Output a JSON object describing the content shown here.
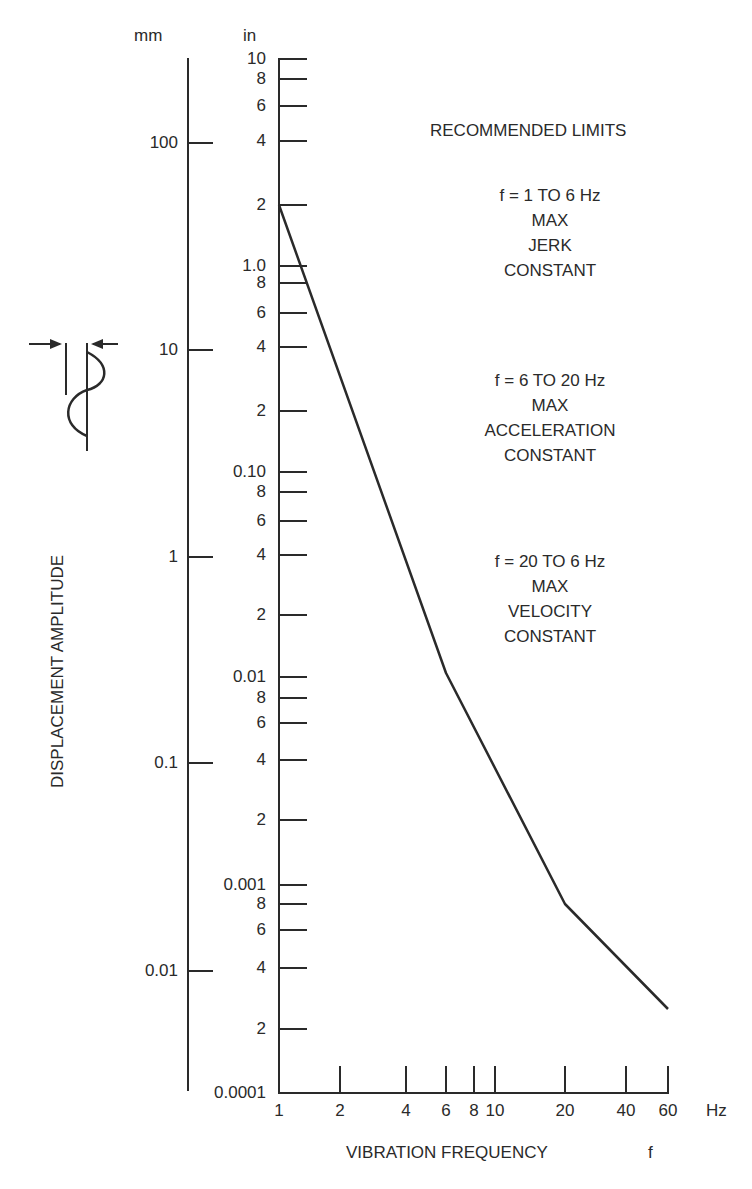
{
  "chart_data": {
    "type": "line",
    "title": "RECOMMENDED LIMITS",
    "xlabel": "VIBRATION FREQUENCY",
    "xlabel_symbol": "f",
    "x_unit": "Hz",
    "ylabel": "DISPLACEMENT AMPLITUDE",
    "y_units": [
      "mm",
      "in"
    ],
    "x_scale": "log",
    "y_scale": "log",
    "xlim": [
      1,
      60
    ],
    "ylim_in": [
      0.0001,
      10
    ],
    "x_ticks": [
      "1",
      "2",
      "4",
      "6",
      "8",
      "10",
      "20",
      "40",
      "60"
    ],
    "y_ticks_in": [
      "10",
      "8",
      "6",
      "4",
      "2",
      "1.0",
      "8",
      "6",
      "4",
      "2",
      "0.10",
      "8",
      "6",
      "4",
      "2",
      "0.01",
      "8",
      "6",
      "4",
      "2",
      "0.001",
      "8",
      "6",
      "4",
      "2",
      "0.0001"
    ],
    "y_ticks_mm": [
      "100",
      "10",
      "1",
      "0.1",
      "0.01"
    ],
    "grid": false,
    "series": [
      {
        "name": "Recommended limit",
        "x": [
          1,
          6,
          20,
          60
        ],
        "y_in": [
          2,
          0.01,
          0.0008,
          0.00025
        ]
      }
    ],
    "annotations": [
      {
        "lines": [
          "f = 1 TO 6 Hz",
          "MAX",
          "JERK",
          "CONSTANT"
        ]
      },
      {
        "lines": [
          "f = 6 TO 20 Hz",
          "MAX",
          "ACCELERATION",
          "CONSTANT"
        ]
      },
      {
        "lines": [
          "f = 20 TO 6 Hz",
          "MAX",
          "VELOCITY",
          "CONSTANT"
        ]
      }
    ]
  },
  "labels": {
    "mm": "mm",
    "in": "in",
    "hz": "Hz",
    "f": "f",
    "xlabel": "VIBRATION FREQUENCY",
    "ylabel": "DISPLACEMENT AMPLITUDE",
    "title": "RECOMMENDED LIMITS"
  },
  "mm_ticks": [
    {
      "label": "100",
      "y": 143
    },
    {
      "label": "10",
      "y": 350
    },
    {
      "label": "1",
      "y": 557
    },
    {
      "label": "0.1",
      "y": 763
    },
    {
      "label": "0.01",
      "y": 971
    }
  ],
  "in_ticks": [
    {
      "label": "10",
      "y": 59
    },
    {
      "label": "8",
      "y": 79
    },
    {
      "label": "6",
      "y": 106
    },
    {
      "label": "4",
      "y": 141
    },
    {
      "label": "2",
      "y": 205
    },
    {
      "label": "1.0",
      "y": 266
    },
    {
      "label": "8",
      "y": 283
    },
    {
      "label": "6",
      "y": 313
    },
    {
      "label": "4",
      "y": 347
    },
    {
      "label": "2",
      "y": 411
    },
    {
      "label": "0.10",
      "y": 472
    },
    {
      "label": "8",
      "y": 492
    },
    {
      "label": "6",
      "y": 521
    },
    {
      "label": "4",
      "y": 555
    },
    {
      "label": "2",
      "y": 615
    },
    {
      "label": "0.01",
      "y": 677
    },
    {
      "label": "8",
      "y": 698
    },
    {
      "label": "6",
      "y": 723
    },
    {
      "label": "4",
      "y": 760
    },
    {
      "label": "2",
      "y": 820
    },
    {
      "label": "0.001",
      "y": 885
    },
    {
      "label": "8",
      "y": 904
    },
    {
      "label": "6",
      "y": 930
    },
    {
      "label": "4",
      "y": 968
    },
    {
      "label": "2",
      "y": 1029
    },
    {
      "label": "0.0001",
      "y": 1093
    }
  ],
  "x_ticks": [
    {
      "label": "1",
      "x": 279
    },
    {
      "label": "2",
      "x": 340
    },
    {
      "label": "4",
      "x": 406
    },
    {
      "label": "6",
      "x": 446
    },
    {
      "label": "8",
      "x": 474
    },
    {
      "label": "10",
      "x": 495
    },
    {
      "label": "20",
      "x": 565
    },
    {
      "label": "40",
      "x": 626
    },
    {
      "label": "60",
      "x": 668
    }
  ],
  "curve_points": "279,205 446,673 565,904 668,1009",
  "colors": {
    "ink": "#2a2a2a",
    "background": "#ffffff"
  }
}
